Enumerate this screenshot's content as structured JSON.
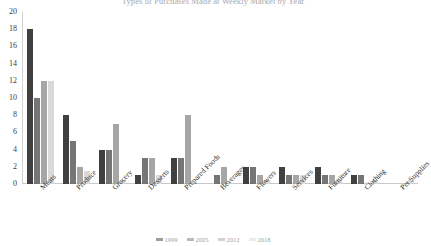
{
  "chart_data": {
    "type": "bar",
    "title": "Types of Purchases Made at Weekly Market by Year",
    "xlabel": "",
    "ylabel": "",
    "ylim": [
      0,
      20
    ],
    "ytick_step": 2,
    "yticks": [
      "20",
      "18",
      "16",
      "14",
      "12",
      "10",
      "8",
      "6",
      "4",
      "2",
      "0"
    ],
    "grid": false,
    "legend_position": "bottom",
    "categories": [
      "Meats",
      "Produce",
      "Grocery",
      "Desserts",
      "Prepared Foods",
      "Beverages",
      "Flowers",
      "Services",
      "Furniture",
      "Clothing",
      "Pet Supplies"
    ],
    "series": [
      {
        "name": "1999",
        "color": "#404040",
        "values": [
          18,
          8,
          4,
          1,
          3,
          0,
          2,
          2,
          2,
          1,
          0
        ]
      },
      {
        "name": "2005",
        "color": "#757575",
        "values": [
          10,
          5,
          4,
          3,
          3,
          1,
          2,
          1,
          1,
          1,
          0
        ]
      },
      {
        "name": "2012",
        "color": "#a6a6a6",
        "values": [
          12,
          2,
          7,
          3,
          8,
          2,
          1,
          1,
          1,
          0,
          0
        ]
      },
      {
        "name": "2018",
        "color": "#d9d9d9",
        "values": [
          12,
          1.5,
          0.5,
          1,
          0,
          0,
          0.5,
          1,
          0.5,
          0.5,
          0.5
        ]
      }
    ]
  },
  "legend": {
    "items": [
      {
        "label": "1999",
        "color": "#404040"
      },
      {
        "label": "2005",
        "color": "#757575"
      },
      {
        "label": "2012",
        "color": "#a6a6a6"
      },
      {
        "label": "2018",
        "color": "#d9d9d9"
      }
    ]
  }
}
